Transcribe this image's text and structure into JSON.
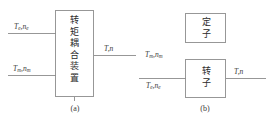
{
  "figure": {
    "type": "block-diagram",
    "panels": [
      {
        "id": "a",
        "caption": "(a)",
        "box_text": "转矩耦合装置",
        "box_text_chars": [
          "转",
          "矩",
          "耦",
          "合",
          "装",
          "置"
        ],
        "inputs": [
          {
            "symbol": "T",
            "symbol_sub": "e",
            "symbol2": "n",
            "symbol2_sub": "e",
            "position": "left-upper"
          },
          {
            "symbol": "T",
            "symbol_sub": "m",
            "symbol2": "n",
            "symbol2_sub": "m",
            "position": "left-lower"
          }
        ],
        "outputs": [
          {
            "symbol": "T",
            "symbol_sub": "",
            "symbol2": "n",
            "symbol2_sub": "",
            "position": "right"
          }
        ]
      },
      {
        "id": "b",
        "caption": "(b)",
        "boxes": [
          {
            "name": "stator",
            "text": "定子",
            "chars": [
              "定",
              "子"
            ]
          },
          {
            "name": "rotor",
            "text": "转子",
            "chars": [
              "转",
              "子"
            ]
          }
        ],
        "inputs": [
          {
            "symbol": "T",
            "symbol_sub": "m",
            "symbol2": "n",
            "symbol2_sub": "m",
            "position": "left-above-line"
          },
          {
            "symbol": "T",
            "symbol_sub": "e",
            "symbol2": "n",
            "symbol2_sub": "e",
            "position": "left-below-line"
          }
        ],
        "outputs": [
          {
            "symbol": "T",
            "symbol_sub": "",
            "symbol2": "n",
            "symbol2_sub": "",
            "position": "right"
          }
        ]
      }
    ],
    "colors": {
      "stroke": "#8c8c8c",
      "text": "#2b2b2b",
      "background": "#ffffff"
    }
  }
}
